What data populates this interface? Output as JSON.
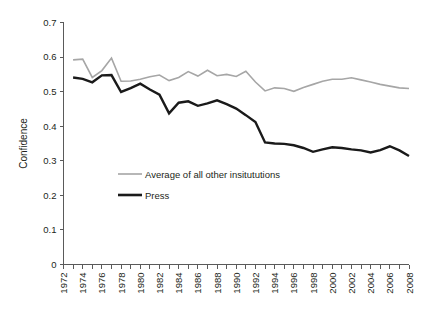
{
  "chart_data": {
    "type": "line",
    "title": "",
    "xlabel": "",
    "ylabel": "Confidence",
    "xlim": [
      1972,
      2008
    ],
    "ylim": [
      0,
      0.7
    ],
    "grid": false,
    "legend_position": "inside-lower-left",
    "y_ticks": [
      "0",
      "0.1",
      "0.2",
      "0.3",
      "0.4",
      "0.5",
      "0.6",
      "0.7"
    ],
    "y_tick_values": [
      0,
      0.1,
      0.2,
      0.3,
      0.4,
      0.5,
      0.6,
      0.7
    ],
    "x_ticks": [
      "1972",
      "1974",
      "1976",
      "1978",
      "1980",
      "1982",
      "1984",
      "1986",
      "1988",
      "1990",
      "1992",
      "1994",
      "1996",
      "1998",
      "2000",
      "2002",
      "2004",
      "2006",
      "2008"
    ],
    "x_tick_values": [
      1972,
      1974,
      1976,
      1978,
      1980,
      1982,
      1984,
      1986,
      1988,
      1990,
      1992,
      1994,
      1996,
      1998,
      2000,
      2002,
      2004,
      2006,
      2008
    ],
    "x_minor_tick_step": 1,
    "x": [
      1973,
      1974,
      1975,
      1976,
      1977,
      1978,
      1979,
      1980,
      1981,
      1982,
      1983,
      1984,
      1985,
      1986,
      1987,
      1988,
      1989,
      1990,
      1991,
      1992,
      1993,
      1994,
      1995,
      1996,
      1997,
      1998,
      1999,
      2000,
      2001,
      2002,
      2003,
      2004,
      2005,
      2006,
      2007,
      2008
    ],
    "series": [
      {
        "name": "Average of all other insitututions",
        "color": "#a6a6a6",
        "width": 1.6,
        "values": [
          0.592,
          0.594,
          0.541,
          0.561,
          0.597,
          0.53,
          0.531,
          0.536,
          0.543,
          0.548,
          0.532,
          0.541,
          0.558,
          0.545,
          0.562,
          0.546,
          0.55,
          0.544,
          0.559,
          0.528,
          0.502,
          0.511,
          0.509,
          0.501,
          0.512,
          0.521,
          0.53,
          0.536,
          0.536,
          0.54,
          0.534,
          0.528,
          0.521,
          0.516,
          0.511,
          0.509
        ]
      },
      {
        "name": "Press",
        "color": "#1a1a1a",
        "width": 2.4,
        "values": [
          0.541,
          0.537,
          0.527,
          0.547,
          0.548,
          0.499,
          0.51,
          0.523,
          0.506,
          0.491,
          0.437,
          0.468,
          0.472,
          0.459,
          0.466,
          0.475,
          0.464,
          0.451,
          0.432,
          0.412,
          0.353,
          0.35,
          0.349,
          0.345,
          0.337,
          0.326,
          0.333,
          0.339,
          0.337,
          0.333,
          0.33,
          0.324,
          0.331,
          0.342,
          0.33,
          0.314
        ]
      }
    ]
  },
  "legend": {
    "items": [
      {
        "label": "Average of all other insitututions",
        "color": "#a6a6a6",
        "width": 1.6
      },
      {
        "label": "Press",
        "color": "#1a1a1a",
        "width": 2.6
      }
    ]
  },
  "axes": {
    "y_title": "Confidence"
  }
}
